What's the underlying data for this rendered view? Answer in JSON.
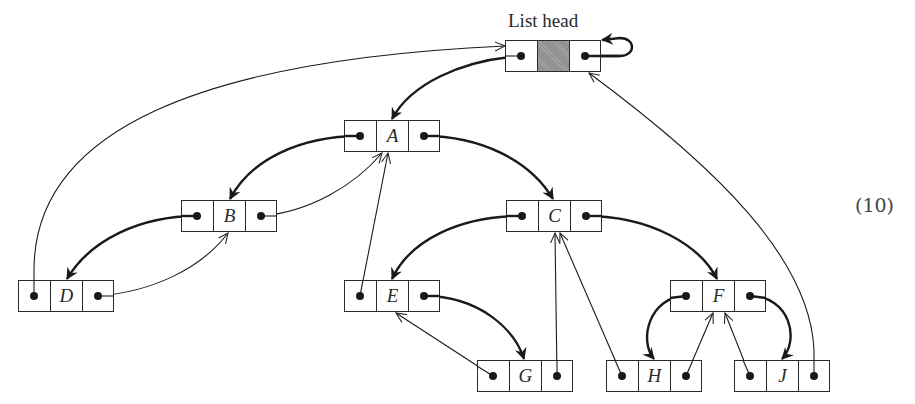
{
  "diagram": {
    "title": "List head",
    "equation_number": "(10)",
    "colors": {
      "stroke": "#2a2a2a",
      "shaded_cell": "#9a9a9a",
      "background": "#ffffff"
    },
    "nodes": {
      "head": {
        "label": "",
        "shaded": true
      },
      "A": {
        "label": "A"
      },
      "B": {
        "label": "B"
      },
      "C": {
        "label": "C"
      },
      "D": {
        "label": "D"
      },
      "E": {
        "label": "E"
      },
      "F": {
        "label": "F"
      },
      "G": {
        "label": "G"
      },
      "H": {
        "label": "H"
      },
      "J": {
        "label": "J"
      }
    },
    "edges": [
      {
        "from": "head.left",
        "to": "A",
        "style": "thick"
      },
      {
        "from": "head.right",
        "to": "head",
        "style": "thick",
        "note": "self-loop"
      },
      {
        "from": "A.left",
        "to": "B",
        "style": "thick"
      },
      {
        "from": "A.right",
        "to": "C",
        "style": "thick"
      },
      {
        "from": "B.left",
        "to": "D",
        "style": "thick"
      },
      {
        "from": "B.right",
        "to": "A",
        "style": "thin"
      },
      {
        "from": "C.left",
        "to": "E",
        "style": "thick"
      },
      {
        "from": "C.right",
        "to": "F",
        "style": "thick"
      },
      {
        "from": "D.left",
        "to": "head",
        "style": "thin"
      },
      {
        "from": "D.right",
        "to": "B",
        "style": "thin"
      },
      {
        "from": "E.left",
        "to": "A",
        "style": "thin"
      },
      {
        "from": "E.right",
        "to": "G",
        "style": "thick"
      },
      {
        "from": "F.left",
        "to": "H",
        "style": "thick"
      },
      {
        "from": "F.right",
        "to": "J",
        "style": "thick"
      },
      {
        "from": "G.left",
        "to": "E",
        "style": "thin"
      },
      {
        "from": "G.right",
        "to": "C",
        "style": "thin"
      },
      {
        "from": "H.left",
        "to": "C",
        "style": "thin"
      },
      {
        "from": "H.right",
        "to": "F",
        "style": "thin"
      },
      {
        "from": "J.left",
        "to": "F",
        "style": "thin"
      },
      {
        "from": "J.right",
        "to": "head",
        "style": "thin"
      }
    ]
  }
}
